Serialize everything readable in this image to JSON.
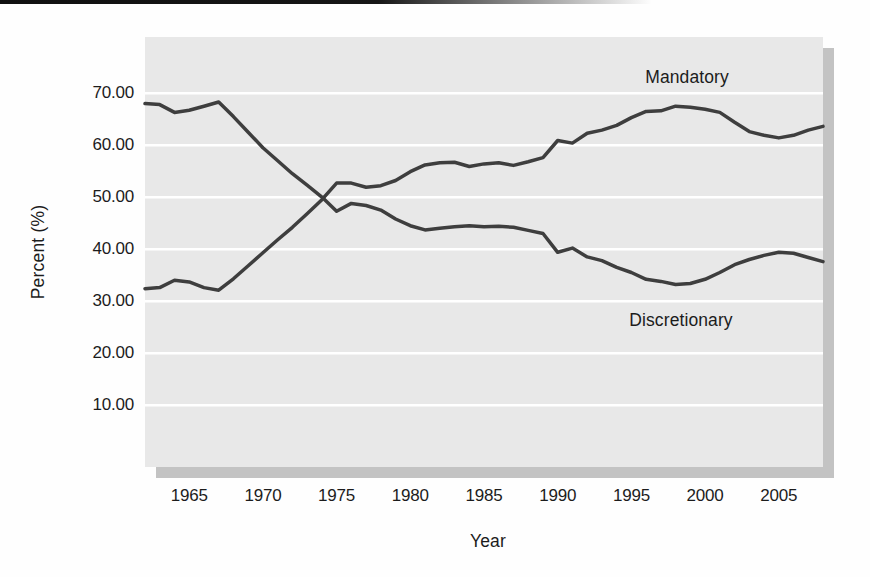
{
  "page": {
    "background": "#fefefe",
    "top_rule_color": "#101010"
  },
  "chart_data": {
    "type": "line",
    "title": "",
    "xlabel": "Year",
    "ylabel": "Percent (%)",
    "grid": "horizontal-white-gridlines",
    "legend_position": "inline-labels-on-plot",
    "plot_bg": "#e8e8e8",
    "gridline_color": "#ffffff",
    "shadow_color": "#c3c3c3",
    "line_color": "#3e3e3e",
    "xlim": [
      1962,
      2008
    ],
    "ylim": [
      -1.9,
      80.8
    ],
    "x_ticks": [
      {
        "value": 1965,
        "label": "1965"
      },
      {
        "value": 1970,
        "label": "1970"
      },
      {
        "value": 1975,
        "label": "1975"
      },
      {
        "value": 1980,
        "label": "1980"
      },
      {
        "value": 1985,
        "label": "1985"
      },
      {
        "value": 1990,
        "label": "1990"
      },
      {
        "value": 1995,
        "label": "1995"
      },
      {
        "value": 2000,
        "label": "2000"
      },
      {
        "value": 2005,
        "label": "2005"
      }
    ],
    "y_ticks": [
      {
        "value": 70,
        "label": "70.00"
      },
      {
        "value": 60,
        "label": "60.00"
      },
      {
        "value": 50,
        "label": "50.00"
      },
      {
        "value": 40,
        "label": "40.00"
      },
      {
        "value": 30,
        "label": "30.00"
      },
      {
        "value": 20,
        "label": "20.00"
      },
      {
        "value": 10,
        "label": "10.00"
      }
    ],
    "x": [
      1962,
      1963,
      1964,
      1965,
      1966,
      1967,
      1968,
      1969,
      1970,
      1971,
      1972,
      1973,
      1974,
      1975,
      1976,
      1977,
      1978,
      1979,
      1980,
      1981,
      1982,
      1983,
      1984,
      1985,
      1986,
      1987,
      1988,
      1989,
      1990,
      1991,
      1992,
      1993,
      1994,
      1995,
      1996,
      1997,
      1998,
      1999,
      2000,
      2001,
      2002,
      2003,
      2004,
      2005,
      2006,
      2007,
      2008
    ],
    "series": [
      {
        "name": "Mandatory",
        "label_px": {
          "x": 687,
          "y": 77
        },
        "values": [
          32.4,
          32.6,
          34.0,
          33.7,
          32.6,
          32.1,
          34.3,
          36.8,
          39.3,
          41.8,
          44.2,
          46.8,
          49.5,
          52.7,
          52.7,
          51.9,
          52.2,
          53.2,
          54.9,
          56.2,
          56.6,
          56.7,
          55.9,
          56.4,
          56.6,
          56.1,
          56.8,
          57.6,
          60.9,
          60.4,
          62.3,
          62.9,
          63.8,
          65.3,
          66.5,
          66.6,
          67.5,
          67.3,
          66.9,
          66.3,
          64.4,
          62.6,
          61.9,
          61.4,
          61.9,
          62.9,
          63.6
        ]
      },
      {
        "name": "Discretionary",
        "label_px": {
          "x": 681,
          "y": 320
        },
        "values": [
          68.0,
          67.8,
          66.3,
          66.7,
          67.5,
          68.3,
          65.5,
          62.5,
          59.5,
          57.0,
          54.5,
          52.3,
          50.0,
          47.3,
          48.8,
          48.4,
          47.5,
          45.8,
          44.5,
          43.7,
          44.0,
          44.3,
          44.5,
          44.3,
          44.4,
          44.2,
          43.6,
          43.0,
          39.4,
          40.2,
          38.5,
          37.8,
          36.5,
          35.5,
          34.2,
          33.8,
          33.2,
          33.4,
          34.2,
          35.5,
          37.0,
          38.0,
          38.8,
          39.4,
          39.2,
          38.4,
          37.6
        ]
      }
    ],
    "layout": {
      "plot_left": 145,
      "plot_top": 37,
      "plot_right": 823,
      "plot_bottom": 467,
      "shadow_offset": 11,
      "line_width": 3.5,
      "gridline_width": 2.5
    }
  }
}
